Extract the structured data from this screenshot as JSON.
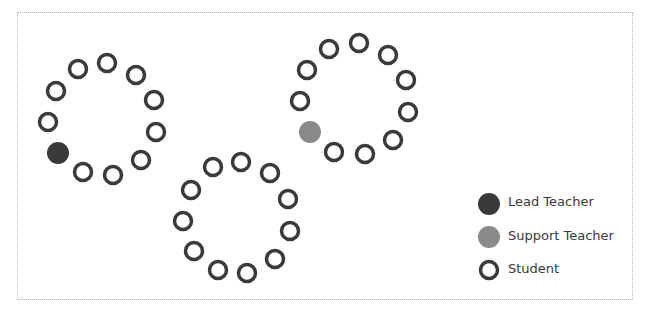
{
  "colors": {
    "lead": "#3a3a3a",
    "support": "#8a8a8a",
    "student_stroke": "#3a3a3a",
    "frame": "#b5b5b5"
  },
  "groups": [
    {
      "name": "group-1",
      "members": [
        "student",
        "student",
        "student",
        "student",
        "student",
        "student",
        "student",
        "lead",
        "student",
        "student",
        "student"
      ]
    },
    {
      "name": "group-2",
      "members": [
        "student",
        "student",
        "student",
        "student",
        "student",
        "student",
        "student",
        "support",
        "student",
        "student",
        "student"
      ]
    },
    {
      "name": "group-3",
      "members": [
        "student",
        "student",
        "student",
        "student",
        "student",
        "student",
        "student",
        "student",
        "student",
        "student",
        "student"
      ]
    }
  ],
  "legend": [
    {
      "type": "lead",
      "label": "Lead Teacher"
    },
    {
      "type": "support",
      "label": "Support Teacher"
    },
    {
      "type": "student",
      "label": "Student"
    }
  ]
}
